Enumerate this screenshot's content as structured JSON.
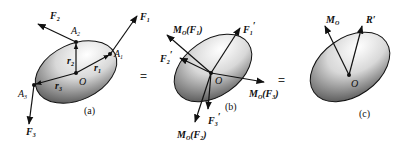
{
  "figure": {
    "panels": [
      {
        "id": "a",
        "caption": "(a)",
        "origin_label": "O",
        "points": [
          "A1",
          "A2",
          "A3"
        ],
        "position_vectors": [
          "r1",
          "r2",
          "r3"
        ],
        "forces": [
          "F1",
          "F2",
          "F3"
        ]
      },
      {
        "id": "b",
        "caption": "(b)",
        "origin_label": "O",
        "forces": [
          "F1'",
          "F2'",
          "F3'"
        ],
        "moments": [
          "MO(F1)",
          "MO(F2)",
          "MO(F3)"
        ]
      },
      {
        "id": "c",
        "caption": "(c)",
        "origin_label": "O",
        "resultants": [
          "MO",
          "R'"
        ]
      }
    ],
    "equals_signs": [
      "=",
      "="
    ]
  },
  "labels": {
    "a": {
      "caption": "(a)",
      "O": "O",
      "F1": "F",
      "F1_sub": "1",
      "F2": "F",
      "F2_sub": "2",
      "F3": "F",
      "F3_sub": "3",
      "A1": "A",
      "A1_sub": "1",
      "A2": "A",
      "A2_sub": "2",
      "A3": "A",
      "A3_sub": "3",
      "r1": "r",
      "r1_sub": "1",
      "r2": "r",
      "r2_sub": "2",
      "r3": "r",
      "r3_sub": "3"
    },
    "b": {
      "caption": "(b)",
      "O": "O",
      "MOF1": "M",
      "MOF1_sub": "O",
      "MOF1_arg": "(F",
      "MOF1_argsub": "1",
      "MOF1_close": ")",
      "MOF2": "M",
      "MOF2_sub": "O",
      "MOF2_arg": "(F",
      "MOF2_argsub": "2",
      "MOF2_close": ")",
      "MOF3": "M",
      "MOF3_sub": "O",
      "MOF3_arg": "(F",
      "MOF3_argsub": "3",
      "MOF3_close": ")",
      "F1p": "F",
      "F1p_sub": "1",
      "F1p_prime": "′",
      "F2p": "F",
      "F2p_sub": "2",
      "F2p_prime": "′",
      "F3p": "F",
      "F3p_sub": "3",
      "F3p_prime": "′"
    },
    "c": {
      "caption": "(c)",
      "O": "O",
      "MO": "M",
      "MO_sub": "O",
      "R": "R′"
    },
    "eq1": "=",
    "eq2": "="
  }
}
